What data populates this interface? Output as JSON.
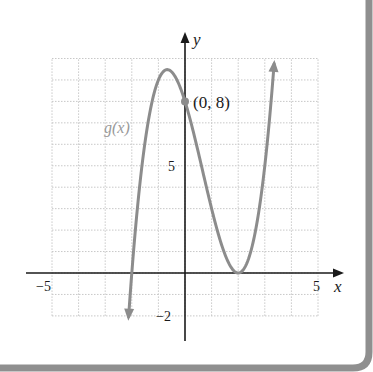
{
  "chart_data": {
    "type": "line",
    "title": "",
    "xlabel": "x",
    "ylabel": "y",
    "xlim": [
      -5,
      5
    ],
    "ylim": [
      -2,
      10
    ],
    "grid": true,
    "x_tick_labels": [
      "-5",
      "5"
    ],
    "y_tick_labels": [
      "5",
      "-2"
    ],
    "series": [
      {
        "name": "g(x)",
        "function": "(x+2)(x-2)^2",
        "x": [
          -2.12,
          -2,
          -1.5,
          -1,
          -0.667,
          0,
          0.5,
          1,
          1.5,
          2,
          2.5,
          3,
          3.35
        ],
        "y": [
          -1.76,
          0,
          3.06,
          9,
          9.48,
          8,
          5.63,
          3,
          0.88,
          0,
          1.13,
          5,
          9.8
        ],
        "color": "#8c8c8c",
        "arrows": "both"
      }
    ],
    "annotations": [
      {
        "text": "(0, 8)",
        "x": 0,
        "y": 8,
        "point": true
      },
      {
        "text": "g(x)",
        "x": -2.5,
        "y": 7.0,
        "role": "curve-label"
      }
    ]
  },
  "labels": {
    "x_axis": "x",
    "y_axis": "y",
    "x_min_tick": "−5",
    "x_max_tick": "5",
    "y_tick_5": "5",
    "y_tick_neg2": "−2",
    "point_label": "(0, 8)",
    "curve_label": "g(x)"
  },
  "colors": {
    "curve": "#8c8c8c",
    "axis": "#1a1a1a",
    "grid": "#c8c8c8",
    "border": "#8f8f8f",
    "curve_label": "#999999"
  }
}
